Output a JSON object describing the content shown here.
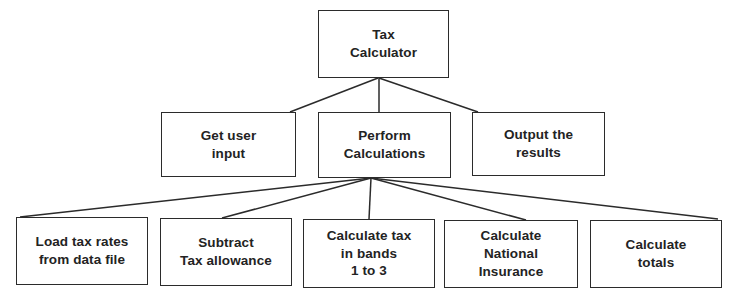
{
  "diagram": {
    "type": "hierarchy-chart",
    "colors": {
      "background": "#ffffff",
      "border": "#2b2b2b",
      "text": "#232323",
      "connector": "#2b2b2b"
    },
    "levels": [
      {
        "level": 1,
        "nodes": [
          {
            "id": "tax-calculator",
            "label": "Tax\nCalculator",
            "x": 318,
            "y": 10,
            "width": 131,
            "height": 68
          }
        ]
      },
      {
        "level": 2,
        "nodes": [
          {
            "id": "get-user-input",
            "label": "Get user\ninput",
            "x": 161,
            "y": 112,
            "width": 135,
            "height": 65
          },
          {
            "id": "perform-calculations",
            "label": "Perform\nCalculations",
            "x": 318,
            "y": 112,
            "width": 133,
            "height": 66
          },
          {
            "id": "output-the-results",
            "label": "Output the\nresults",
            "x": 472,
            "y": 112,
            "width": 133,
            "height": 64
          }
        ]
      },
      {
        "level": 3,
        "nodes": [
          {
            "id": "load-tax-rates",
            "label": "Load tax rates\nfrom data file",
            "x": 16,
            "y": 217,
            "width": 132,
            "height": 68
          },
          {
            "id": "subtract-tax-allowance",
            "label": "Subtract\nTax allowance",
            "x": 160,
            "y": 218,
            "width": 132,
            "height": 68
          },
          {
            "id": "calculate-tax-in-bands",
            "label": "Calculate tax\nin bands\n1 to 3",
            "x": 303,
            "y": 219,
            "width": 132,
            "height": 69
          },
          {
            "id": "calculate-national-insurance",
            "label": "Calculate\nNational\nInsurance",
            "x": 444,
            "y": 220,
            "width": 134,
            "height": 68
          },
          {
            "id": "calculate-totals",
            "label": "Calculate\ntotals",
            "x": 590,
            "y": 220,
            "width": 132,
            "height": 68
          }
        ]
      }
    ],
    "connectors": [
      {
        "id": "root-to-get-user-input",
        "from": "tax-calculator",
        "to": "get-user-input",
        "x1": 378,
        "y1": 78,
        "x2": 290,
        "y2": 112
      },
      {
        "id": "root-to-perform-calculations",
        "from": "tax-calculator",
        "to": "perform-calculations",
        "x1": 379,
        "y1": 78,
        "x2": 379,
        "y2": 112
      },
      {
        "id": "root-to-output-the-results",
        "from": "tax-calculator",
        "to": "output-the-results",
        "x1": 379,
        "y1": 78,
        "x2": 478,
        "y2": 112
      },
      {
        "id": "perform-to-load-tax-rates",
        "from": "perform-calculations",
        "to": "load-tax-rates",
        "x1": 371,
        "y1": 178,
        "x2": 20,
        "y2": 217
      },
      {
        "id": "perform-to-subtract-tax-allowance",
        "from": "perform-calculations",
        "to": "subtract-tax-allowance",
        "x1": 371,
        "y1": 178,
        "x2": 222,
        "y2": 218
      },
      {
        "id": "perform-to-calculate-tax-in-bands",
        "from": "perform-calculations",
        "to": "calculate-tax-in-bands",
        "x1": 371,
        "y1": 178,
        "x2": 369,
        "y2": 219
      },
      {
        "id": "perform-to-calculate-national-insurance",
        "from": "perform-calculations",
        "to": "calculate-national-insurance",
        "x1": 371,
        "y1": 178,
        "x2": 526,
        "y2": 220
      },
      {
        "id": "perform-to-calculate-totals",
        "from": "perform-calculations",
        "to": "calculate-totals",
        "x1": 371,
        "y1": 178,
        "x2": 718,
        "y2": 219
      }
    ]
  }
}
